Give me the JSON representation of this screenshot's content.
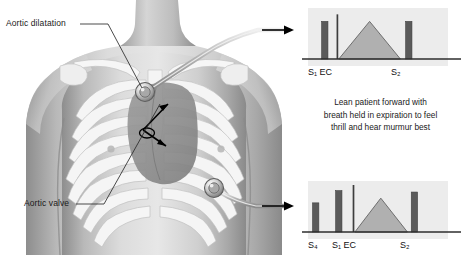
{
  "anatomy": {
    "labels": [
      {
        "id": "aortic-dilatation",
        "text": "Aortic dilatation"
      },
      {
        "id": "aortic-valve",
        "text": "Aortic valve"
      }
    ],
    "markers": [
      {
        "name": "stethoscope-upper",
        "description": "stethoscope chest piece at 2nd right intercostal space"
      },
      {
        "name": "stethoscope-lower",
        "description": "stethoscope chest piece at left lower sternal border"
      },
      {
        "name": "radiation-arrow",
        "description": "double-headed arrow showing murmur radiation"
      }
    ]
  },
  "instruction": {
    "line1": "Lean patient forward with",
    "line2": "breath held in expiration to feel",
    "line3": "thrill and hear murmur best"
  },
  "colors": {
    "panel_background": "#ececec",
    "bar_fill": "#5a5a5a",
    "murmur_fill": "#b0b0b0",
    "murmur_stroke": "#6e6e6e",
    "baseline": "#2e2e2e",
    "skin_light": "#e8e8e8",
    "skin_mid": "#c9c9c9",
    "skin_dark": "#9a9a9a",
    "bone": "#f4f4f4",
    "heart": "#8c8c8c",
    "arrow": "#000000"
  },
  "chart_data": [
    {
      "type": "bar",
      "id": "phonocardiogram-upper",
      "title": "Aortic stenosis phonocardiogram (base)",
      "xlabel": "",
      "ylabel": "",
      "grid": false,
      "legend": null,
      "categories": [
        "S1",
        "EC",
        "S2"
      ],
      "tick_labels": [
        "S₁ EC",
        "S₂"
      ],
      "values": [
        0.8,
        0.95,
        0.8
      ],
      "ylim": [
        0,
        1
      ],
      "bars": [
        {
          "label": "S1",
          "x": 0.12,
          "height": 0.8,
          "width": 0.045,
          "kind": "heart-sound"
        },
        {
          "label": "EC",
          "x": 0.21,
          "height": 0.95,
          "width": 0.012,
          "kind": "ejection-click"
        },
        {
          "label": "S2",
          "x": 0.72,
          "height": 0.8,
          "width": 0.045,
          "kind": "heart-sound"
        }
      ],
      "murmur": {
        "shape": "diamond",
        "description": "crescendo-decrescendo ejection systolic murmur",
        "start_x": 0.22,
        "peak_x": 0.44,
        "end_x": 0.66,
        "peak_height": 0.8
      }
    },
    {
      "type": "bar",
      "id": "phonocardiogram-lower",
      "title": "Aortic stenosis phonocardiogram with S4 (apex)",
      "xlabel": "",
      "ylabel": "",
      "grid": false,
      "legend": null,
      "categories": [
        "S4",
        "S1",
        "EC",
        "S2"
      ],
      "tick_labels": [
        "S₄",
        "S₁ EC",
        "S₂"
      ],
      "values": [
        0.62,
        0.88,
        1.0,
        0.85
      ],
      "ylim": [
        0,
        1
      ],
      "bars": [
        {
          "label": "S4",
          "x": 0.055,
          "height": 0.62,
          "width": 0.045,
          "kind": "heart-sound"
        },
        {
          "label": "S1",
          "x": 0.22,
          "height": 0.88,
          "width": 0.045,
          "kind": "heart-sound"
        },
        {
          "label": "EC",
          "x": 0.325,
          "height": 1.0,
          "width": 0.012,
          "kind": "ejection-click"
        },
        {
          "label": "S2",
          "x": 0.76,
          "height": 0.85,
          "width": 0.045,
          "kind": "heart-sound"
        }
      ],
      "murmur": {
        "shape": "diamond",
        "description": "crescendo-decrescendo ejection systolic murmur",
        "start_x": 0.335,
        "peak_x": 0.52,
        "end_x": 0.71,
        "peak_height": 0.72
      }
    }
  ],
  "phono_label_positions": {
    "upper": [
      {
        "text_html": "S₁ EC",
        "left": 0
      },
      {
        "text_html": "S₂",
        "left": 83
      }
    ],
    "lower": [
      {
        "text_html": "S₄",
        "left": 0
      },
      {
        "text_html": "S₁ EC",
        "left": 24
      },
      {
        "text_html": "S₂",
        "left": 92
      }
    ]
  }
}
